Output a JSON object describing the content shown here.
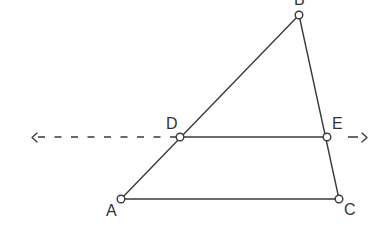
{
  "diagram": {
    "type": "geometry-triangle-with-parallel-line",
    "points": {
      "A": {
        "label": "A",
        "x": 121,
        "y": 199
      },
      "B": {
        "label": "B",
        "x": 299,
        "y": 15
      },
      "C": {
        "label": "C",
        "x": 339,
        "y": 199
      },
      "D": {
        "label": "D",
        "x": 180,
        "y": 137
      },
      "E": {
        "label": "E",
        "x": 327,
        "y": 137
      }
    },
    "segments": [
      {
        "from": "A",
        "to": "B"
      },
      {
        "from": "B",
        "to": "C"
      },
      {
        "from": "A",
        "to": "C"
      },
      {
        "from": "D",
        "to": "E"
      }
    ],
    "dashed_line": {
      "through": [
        "D",
        "E"
      ],
      "left_arrow": "<",
      "right_arrow": ">"
    },
    "colors": {
      "stroke": "#3a3a3a",
      "text": "#333333",
      "background": "#ffffff"
    }
  }
}
